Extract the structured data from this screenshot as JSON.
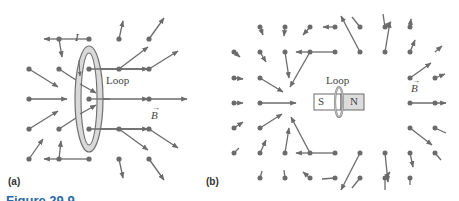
{
  "figure": {
    "caption": "Figure 29.9",
    "panel_a": {
      "label": "(a)",
      "loop_label": "Loop",
      "current_label": "I",
      "field_label": "B"
    },
    "panel_b": {
      "label": "(b)",
      "loop_label": "Loop",
      "magnet_south": "S",
      "magnet_north": "N",
      "field_label": "B"
    },
    "colors": {
      "vector": "#6b6b6b",
      "dot": "#6b6b6b",
      "loop_fill": "#d9d9d9",
      "loop_stroke": "#6f6f6f",
      "magnet_south_fill": "#ffffff",
      "magnet_north_fill": "#dcdcdc",
      "caption": "#2a6aa8"
    }
  }
}
